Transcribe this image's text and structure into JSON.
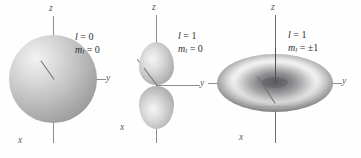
{
  "figure": {
    "background_color": "#fefefe",
    "axis_color": "#8d8d8f",
    "label_color": "#2e2e30"
  },
  "panels": [
    {
      "id": "s-orbital",
      "shape": "sphere",
      "quantum_numbers": {
        "l_symbol": "l",
        "l_equals": "=",
        "l_value": "0",
        "m_symbol": "m",
        "m_subscript": "l",
        "m_equals": "=",
        "m_value": "0"
      },
      "axes": [
        {
          "name": "z",
          "label": "z"
        },
        {
          "name": "y",
          "label": "y"
        },
        {
          "name": "x",
          "label": "x"
        }
      ]
    },
    {
      "id": "p-z-orbital",
      "shape": "dumbbell",
      "quantum_numbers": {
        "l_symbol": "l",
        "l_equals": "=",
        "l_value": "1",
        "m_symbol": "m",
        "m_subscript": "l",
        "m_equals": "=",
        "m_value": "0"
      },
      "axes": [
        {
          "name": "z",
          "label": "z"
        },
        {
          "name": "y",
          "label": "y"
        },
        {
          "name": "x",
          "label": "x"
        }
      ]
    },
    {
      "id": "p-pm1-orbital",
      "shape": "torus",
      "quantum_numbers": {
        "l_symbol": "l",
        "l_equals": "=",
        "l_value": "1",
        "m_symbol": "m",
        "m_subscript": "l",
        "m_equals": "=",
        "m_value": "±1"
      },
      "axes": [
        {
          "name": "z",
          "label": "z"
        },
        {
          "name": "y",
          "label": "y"
        },
        {
          "name": "x",
          "label": "x"
        }
      ]
    }
  ]
}
